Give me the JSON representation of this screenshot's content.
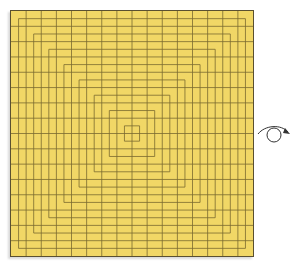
{
  "diagram": {
    "type": "crease-pattern",
    "sheet": {
      "color": "#f1d766",
      "line_color": "#7a6a30",
      "border_color": "#5a5030",
      "divisions": 32
    },
    "action": {
      "icon": "rotate-over-icon",
      "meaning": "turn over"
    }
  }
}
